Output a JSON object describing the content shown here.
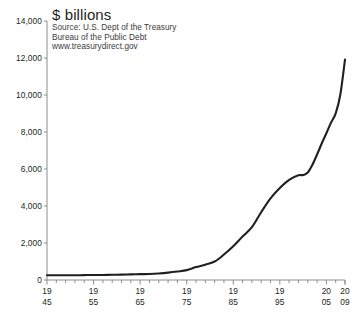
{
  "chart_data": {
    "type": "line",
    "title": "$ billions",
    "subtitle_lines": [
      "Source: U.S. Dept of the Treasury",
      "Bureau of the Public Debt",
      "www.treasurydirect.gov"
    ],
    "xlabel": "",
    "ylabel": "",
    "xlim": [
      1945,
      2009
    ],
    "ylim": [
      0,
      14000
    ],
    "grid": false,
    "legend": "none",
    "line_color": "#231f20",
    "y_ticks": [
      0,
      2000,
      4000,
      6000,
      8000,
      10000,
      12000,
      14000
    ],
    "y_tick_labels": [
      "0",
      "2,000",
      "4,000",
      "6,000",
      "8,000",
      "10,000",
      "12,000",
      "14,000"
    ],
    "x_tick_step_years": 2,
    "x_labeled_ticks": [
      {
        "year": 1945,
        "top": "19",
        "bottom": "45"
      },
      {
        "year": 1955,
        "top": "19",
        "bottom": "55"
      },
      {
        "year": 1965,
        "top": "19",
        "bottom": "65"
      },
      {
        "year": 1975,
        "top": "19",
        "bottom": "75"
      },
      {
        "year": 1985,
        "top": "19",
        "bottom": "85"
      },
      {
        "year": 1995,
        "top": "19",
        "bottom": "95"
      },
      {
        "year": 2005,
        "top": "20",
        "bottom": "05"
      },
      {
        "year": 2009,
        "top": "20",
        "bottom": "09"
      }
    ],
    "x": [
      1945,
      1947,
      1949,
      1951,
      1953,
      1955,
      1957,
      1959,
      1961,
      1963,
      1965,
      1967,
      1969,
      1971,
      1973,
      1975,
      1977,
      1979,
      1981,
      1983,
      1985,
      1987,
      1989,
      1991,
      1993,
      1995,
      1997,
      1999,
      2000,
      2001,
      2002,
      2003,
      2004,
      2005,
      2006,
      2007,
      2008,
      2009
    ],
    "values": [
      259,
      258,
      253,
      255,
      266,
      274,
      271,
      285,
      289,
      306,
      317,
      326,
      354,
      398,
      458,
      533,
      699,
      827,
      998,
      1377,
      1823,
      2350,
      2857,
      3665,
      4411,
      4974,
      5413,
      5656,
      5674,
      5807,
      6228,
      6783,
      7379,
      7933,
      8507,
      9008,
      10025,
      11910
    ],
    "series": [
      {
        "name": "U.S. public debt",
        "values": [
          259,
          258,
          253,
          255,
          266,
          274,
          271,
          285,
          289,
          306,
          317,
          326,
          354,
          398,
          458,
          533,
          699,
          827,
          998,
          1377,
          1823,
          2350,
          2857,
          3665,
          4411,
          4974,
          5413,
          5656,
          5674,
          5807,
          6228,
          6783,
          7379,
          7933,
          8507,
          9008,
          10025,
          11910
        ]
      }
    ]
  }
}
